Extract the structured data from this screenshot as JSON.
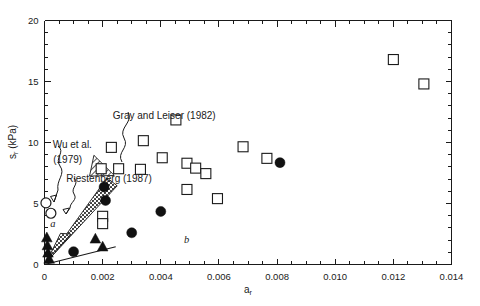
{
  "chart_data": {
    "type": "scatter",
    "title": "",
    "xlabel": "a_r",
    "xlabel_base": "a",
    "xlabel_sub": "r",
    "ylabel": "s_r (kPa)",
    "ylabel_base": "s",
    "ylabel_sub": "r",
    "ylabel_unit": " (kPa)",
    "xlim": [
      0,
      0.014
    ],
    "ylim": [
      0,
      20
    ],
    "xticks": [
      0,
      0.002,
      0.004,
      0.006,
      0.008,
      0.01,
      0.012,
      0.014
    ],
    "xticklabels": [
      "0",
      "0.002",
      "0.004",
      "0.006",
      "0.008",
      "0.010",
      "0.012",
      "0.014"
    ],
    "xminor_step": 0.0005,
    "yticks": [
      0,
      5,
      10,
      15,
      20
    ],
    "yticklabels": [
      "0",
      "5",
      "10",
      "15",
      "20"
    ],
    "yminor_step": 1,
    "grid": false,
    "legend_position": "none",
    "series": [
      {
        "name": "open-square",
        "marker": "open square",
        "points": [
          {
            "x": 0.0023,
            "y": 9.6
          },
          {
            "x": 0.00255,
            "y": 7.85
          },
          {
            "x": 0.00195,
            "y": 7.85
          },
          {
            "x": 0.0034,
            "y": 10.15
          },
          {
            "x": 0.00405,
            "y": 8.75
          },
          {
            "x": 0.0033,
            "y": 7.8
          },
          {
            "x": 0.00452,
            "y": 11.85
          },
          {
            "x": 0.0049,
            "y": 8.3
          },
          {
            "x": 0.0052,
            "y": 7.9
          },
          {
            "x": 0.00555,
            "y": 7.45
          },
          {
            "x": 0.0049,
            "y": 6.15
          },
          {
            "x": 0.00595,
            "y": 5.4
          },
          {
            "x": 0.00683,
            "y": 9.65
          },
          {
            "x": 0.00765,
            "y": 8.7
          },
          {
            "x": 0.012,
            "y": 16.8
          },
          {
            "x": 0.01305,
            "y": 14.8
          },
          {
            "x": 0.002,
            "y": 3.95
          },
          {
            "x": 0.002,
            "y": 3.35
          }
        ]
      },
      {
        "name": "filled-circle",
        "marker": "filled circle",
        "points": [
          {
            "x": 0.00205,
            "y": 6.35
          },
          {
            "x": 0.0021,
            "y": 5.25
          },
          {
            "x": 0.003,
            "y": 2.6
          },
          {
            "x": 0.004,
            "y": 4.35
          },
          {
            "x": 0.0081,
            "y": 8.35
          },
          {
            "x": 0.001,
            "y": 1.05
          }
        ]
      },
      {
        "name": "filled-triangle",
        "marker": "filled triangle",
        "points": [
          {
            "x": 8e-05,
            "y": 2.2
          },
          {
            "x": 0.0001,
            "y": 1.55
          },
          {
            "x": 0.00012,
            "y": 0.95
          },
          {
            "x": 0.00175,
            "y": 2.1
          },
          {
            "x": 0.002,
            "y": 1.45
          },
          {
            "x": 0.00016,
            "y": 0.45
          }
        ]
      },
      {
        "name": "open-circle",
        "marker": "open circle",
        "points": [
          {
            "x": 5e-05,
            "y": 5.05
          },
          {
            "x": 0.00022,
            "y": 4.2
          }
        ]
      }
    ],
    "lines": [
      {
        "name": "envelope-a",
        "x": [
          0.0,
          0.00245
        ],
        "y": [
          0.0,
          1.45
        ],
        "style": "solid"
      }
    ],
    "wedges": [
      {
        "name": "riestenberg-wedge",
        "fill": "dotted",
        "vertices": [
          [
            5e-05,
            0.15
          ],
          [
            0.00215,
            7.1
          ],
          [
            0.0025,
            6.45
          ]
        ]
      },
      {
        "name": "wu-wedge",
        "fill": "dotted",
        "vertices": [
          [
            5e-05,
            0.1
          ],
          [
            0.00055,
            2.55
          ],
          [
            0.0009,
            2.5
          ]
        ]
      },
      {
        "name": "gray-leiser-wedge",
        "fill": "hatched",
        "vertices": [
          [
            0.0017,
            8.95
          ],
          [
            0.0024,
            7.3
          ],
          [
            0.00155,
            7.25
          ]
        ]
      }
    ],
    "annotations": [
      {
        "name": "gray-and-leiser-label",
        "text": "Gray and Leiser (1982)",
        "x": 0.00235,
        "y": 11.9
      },
      {
        "name": "wu-et-al-label-line1",
        "text": "Wu et al.",
        "x": 0.00028,
        "y": 9.55
      },
      {
        "name": "wu-et-al-label-line2",
        "text": "(1979)",
        "x": 0.0003,
        "y": 8.35
      },
      {
        "name": "riestenberg-label",
        "text": "Riestenberg (1987)",
        "x": 0.00075,
        "y": 6.75
      },
      {
        "name": "region-label-a",
        "text": "a",
        "x": 0.0002,
        "y": 3.05,
        "italic": true
      },
      {
        "name": "region-label-b",
        "text": "b",
        "x": 0.0048,
        "y": 1.75,
        "italic": true
      }
    ]
  }
}
